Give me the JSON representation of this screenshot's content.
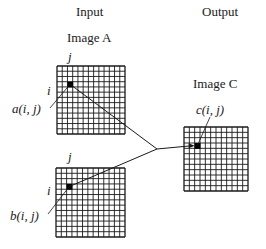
{
  "headers": {
    "input": "Input",
    "output": "Output"
  },
  "images": {
    "a": {
      "title": "Image A",
      "col_label": "j",
      "row_label": "i",
      "pixel_label": "a(i, j)",
      "grid": {
        "x": 57,
        "y": 66,
        "size": 68,
        "cells": 13
      },
      "pixel": {
        "col": 2,
        "row": 3
      }
    },
    "b": {
      "col_label": "j",
      "row_label": "i",
      "pixel_label": "b(i, j)",
      "grid": {
        "x": 56,
        "y": 168,
        "size": 69,
        "cells": 13
      },
      "pixel": {
        "col": 2,
        "row": 3
      }
    },
    "c": {
      "title": "Image C",
      "pixel_label": "c(i, j)",
      "grid": {
        "x": 184,
        "y": 127,
        "size": 64,
        "cells": 12
      },
      "pixel": {
        "col": 2,
        "row": 3
      }
    }
  },
  "connector": {
    "merge_point": {
      "x": 157,
      "y": 149
    },
    "arrow": "arrow-right"
  },
  "colors": {
    "line": "#1a1a1a",
    "background": "#ffffff",
    "pixel_fill": "#000000"
  }
}
